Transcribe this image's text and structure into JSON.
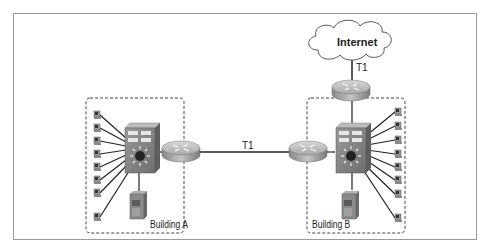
{
  "diagram": {
    "type": "network-topology",
    "nodes": {
      "internet": {
        "label": "Internet"
      },
      "building_a": {
        "label": "Building A",
        "workstations": 8
      },
      "building_b": {
        "label": "Building B",
        "workstations": 8
      }
    },
    "links": {
      "wan_link": {
        "label": "T1",
        "from": "Building A router",
        "to": "Building B router"
      },
      "internet_link": {
        "label": "T1",
        "from": "Internet",
        "to": "Internet router"
      }
    }
  },
  "colors": {
    "frame": "#9a9a9a",
    "line": "#222222",
    "router": "#b8b8b8",
    "switch": "#8a8a8a",
    "dashed_border": "#444444"
  }
}
